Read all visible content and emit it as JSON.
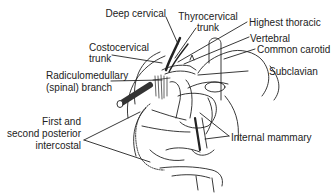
{
  "diagram": {
    "labels": {
      "deep_cervical": "Deep cervical",
      "thyrocervical_1": "Thyrocervical",
      "thyrocervical_2": "trunk",
      "highest_thoracic": "Highest thoracic",
      "vertebral": "Vertebral",
      "common_carotid": "Common carotid",
      "costocervical_1": "Costocervical",
      "costocervical_2": "trunk",
      "subclavian": "Subclavian",
      "radiculomedullary_1": "Radiculomedullary",
      "radiculomedullary_2": "(spinal) branch",
      "intercostal_1": "First and",
      "intercostal_2": "second posterior",
      "intercostal_3": "intercostal",
      "internal_mammary": "Internal mammary"
    },
    "colors": {
      "ink": "#222222",
      "background": "#ffffff"
    }
  }
}
